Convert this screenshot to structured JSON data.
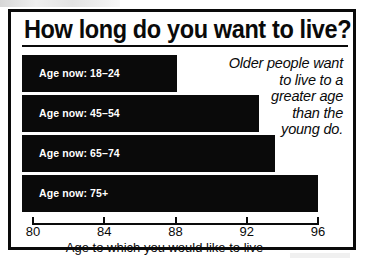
{
  "figure": {
    "title": "How long do you want to live?",
    "annotation": "Older people want to live to a greater age than the young do.",
    "annotation_lines": [
      "Older people want",
      "to live to a",
      "greater age",
      "than the",
      "young do."
    ]
  },
  "chart_data": {
    "type": "bar",
    "orientation": "horizontal",
    "title": "How long do you want to live?",
    "xlabel": "Age to which you would like to live",
    "ylabel": "",
    "xlim": [
      80,
      96
    ],
    "xticks": [
      80,
      84,
      88,
      92,
      96
    ],
    "xticklabels": [
      "80",
      "84",
      "88",
      "92",
      "96"
    ],
    "grid": false,
    "legend": null,
    "categories": [
      "Age now: 18–24",
      "Age now: 45–54",
      "Age now: 65–74",
      "Age now: 75+"
    ],
    "values": [
      88.1,
      92.7,
      93.6,
      96.0
    ],
    "bar_color": "#0a0a0a",
    "label_color": "#ffffff",
    "background": "#ffffff",
    "annotation": "Older people want to live to a greater age than the young do."
  },
  "colors": {
    "ink": "#0a0a0a",
    "paper": "#ffffff"
  }
}
